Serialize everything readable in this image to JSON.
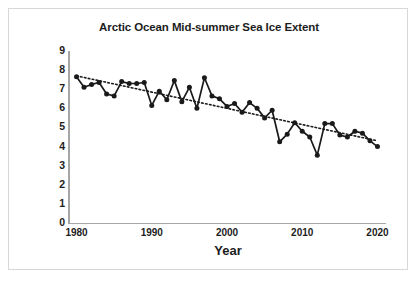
{
  "chart_data": {
    "type": "line",
    "title": "Arctic Ocean Mid-summer Sea Ice Extent",
    "xlabel": "Year",
    "ylabel": "Minimum Sea Ice (10⁶ km²)",
    "ylabel_text": "Minimum Sea Ice (10",
    "ylabel_sup": "6",
    "ylabel_tail": " km",
    "ylabel_sup2": "2",
    "ylabel_close": ")",
    "xlim": [
      1979,
      2021
    ],
    "ylim": [
      0,
      9
    ],
    "grid": false,
    "legend": "none",
    "ytick_labels": [
      "9",
      "8",
      "7",
      "6",
      "5",
      "4",
      "3",
      "2",
      "1",
      "0"
    ],
    "ytick_values": [
      9,
      8,
      7,
      6,
      5,
      4,
      3,
      2,
      1,
      0
    ],
    "xtick_labels": [
      "1980",
      "1990",
      "2000",
      "2010",
      "2020"
    ],
    "xtick_values": [
      1980,
      1990,
      2000,
      2010,
      2020
    ],
    "marker": "filled-circle",
    "series": [
      {
        "name": "Minimum sea ice extent",
        "style": "solid-line-with-markers",
        "color": "#1a1a1a",
        "x": [
          1980,
          1981,
          1982,
          1983,
          1984,
          1985,
          1986,
          1987,
          1988,
          1989,
          1990,
          1991,
          1992,
          1993,
          1994,
          1995,
          1996,
          1997,
          1998,
          1999,
          2000,
          2001,
          2002,
          2003,
          2004,
          2005,
          2006,
          2007,
          2008,
          2009,
          2010,
          2011,
          2012,
          2013,
          2014,
          2015,
          2016,
          2017,
          2018,
          2019,
          2020
        ],
        "values": [
          7.65,
          7.1,
          7.25,
          7.35,
          6.75,
          6.65,
          7.4,
          7.3,
          7.3,
          7.35,
          6.15,
          6.9,
          6.45,
          7.45,
          6.35,
          7.1,
          6.0,
          7.6,
          6.65,
          6.5,
          6.1,
          6.25,
          5.8,
          6.3,
          6.0,
          5.5,
          5.9,
          4.25,
          4.65,
          5.25,
          4.8,
          4.5,
          3.55,
          5.2,
          5.2,
          4.6,
          4.5,
          4.8,
          4.7,
          4.3,
          4.0
        ]
      },
      {
        "name": "Linear trend",
        "style": "dotted-line",
        "color": "#1a1a1a",
        "x": [
          1980,
          2020
        ],
        "values": [
          7.7,
          4.3
        ]
      }
    ]
  }
}
